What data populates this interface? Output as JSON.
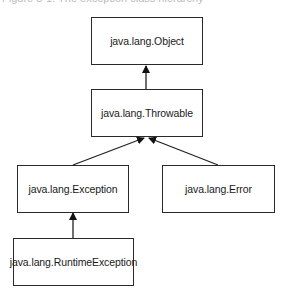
{
  "caption": "Figure 8-1: The exception class hierarchy",
  "nodes": {
    "object": {
      "label": "java.lang.Object"
    },
    "throwable": {
      "label": "java.lang.Throwable"
    },
    "exception": {
      "label": "java.lang.Exception"
    },
    "error": {
      "label": "java.lang.Error"
    },
    "runtime_exception": {
      "label": "java.lang.RuntimeException"
    }
  },
  "edges": [
    {
      "from": "java.lang.Throwable",
      "to": "java.lang.Object"
    },
    {
      "from": "java.lang.Exception",
      "to": "java.lang.Throwable"
    },
    {
      "from": "java.lang.Error",
      "to": "java.lang.Throwable"
    },
    {
      "from": "java.lang.RuntimeException",
      "to": "java.lang.Exception"
    }
  ]
}
